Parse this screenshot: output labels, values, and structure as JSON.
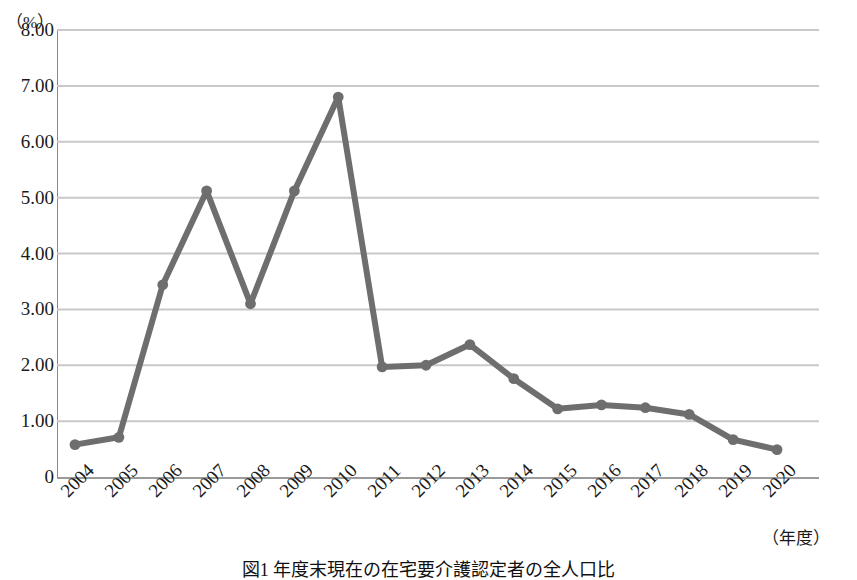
{
  "figure": {
    "caption": "図1 年度末現在の在宅要介護認定者の全人口比",
    "y_unit_label": "（%）",
    "x_unit_label": "（年度）"
  },
  "chart_data": {
    "type": "line",
    "title": "",
    "xlabel": "（年度）",
    "ylabel": "（%）",
    "categories": [
      "2004",
      "2005",
      "2006",
      "2007",
      "2008",
      "2009",
      "2010",
      "2011",
      "2012",
      "2013",
      "2014",
      "2015",
      "2016",
      "2017",
      "2018",
      "2019",
      "2020"
    ],
    "values": [
      0.58,
      0.71,
      3.44,
      5.12,
      3.1,
      5.12,
      6.8,
      1.97,
      2.0,
      2.37,
      1.76,
      1.22,
      1.29,
      1.24,
      1.12,
      0.67,
      0.49
    ],
    "ylim": [
      0,
      8
    ],
    "ytick_labels": [
      "8.00",
      "7.00",
      "6.00",
      "5.00",
      "4.00",
      "3.00",
      "2.00",
      "1.00",
      "0"
    ],
    "ytick_values": [
      8,
      7,
      6,
      5,
      4,
      3,
      2,
      1,
      0
    ],
    "grid": true,
    "grid_color": "#c9c9c9",
    "legend": null,
    "series_color": "#6e6e6e",
    "marker": "circle",
    "marker_color": "#6e6e6e"
  }
}
